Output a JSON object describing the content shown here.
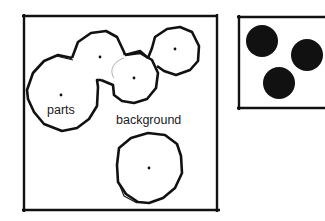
{
  "figure": {
    "left_panel": {
      "labels": {
        "parts": "parts",
        "background": "background"
      },
      "parts": [
        {
          "name": "part-large-left",
          "cx": 61,
          "cy": 95,
          "r": 38
        },
        {
          "name": "part-top-middle",
          "cx": 100,
          "cy": 57,
          "r": 24
        },
        {
          "name": "part-middle",
          "cx": 134,
          "cy": 78,
          "r": 24
        },
        {
          "name": "part-top-right",
          "cx": 175,
          "cy": 49,
          "r": 25
        },
        {
          "name": "part-bottom",
          "cx": 149,
          "cy": 168,
          "r": 34
        }
      ]
    },
    "right_panel": {
      "blobs": [
        {
          "name": "blob-1",
          "cx": 262,
          "cy": 41,
          "r": 16
        },
        {
          "name": "blob-2",
          "cx": 307,
          "cy": 55,
          "r": 16
        },
        {
          "name": "blob-3",
          "cx": 279,
          "cy": 83,
          "r": 16
        }
      ]
    },
    "colors": {
      "ink": "#111111",
      "background": "#ffffff"
    }
  }
}
